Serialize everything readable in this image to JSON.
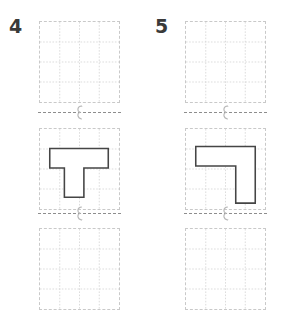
{
  "page": {
    "type": "geometry-worksheet",
    "background_color": "#ffffff",
    "grid_line_color": "#d2d2d2",
    "panel_border_color": "#c9c9c9",
    "shape_stroke_color": "#454545",
    "number_color": "#3a3a3a",
    "separator_color": "#8d8d8d"
  },
  "grid": {
    "columns": 4,
    "rows": 4,
    "cell_size_px": 20
  },
  "problems": [
    {
      "number": "4",
      "panels": [
        {
          "position": "top",
          "state": "empty",
          "shape": null
        },
        {
          "position": "middle",
          "state": "filled",
          "shape": {
            "name": "T-shape",
            "points": "10,20 70,20 70,40 45,40 45,70 25,70 25,40 10,40"
          }
        },
        {
          "position": "bottom",
          "state": "empty",
          "shape": null
        }
      ],
      "separators": [
        {
          "position": "upper",
          "glyph": "fold-arrow-icon"
        },
        {
          "position": "lower",
          "glyph": "fold-arrow-icon"
        }
      ]
    },
    {
      "number": "5",
      "panels": [
        {
          "position": "top",
          "state": "empty",
          "shape": null
        },
        {
          "position": "middle",
          "state": "filled",
          "shape": {
            "name": "L-shape",
            "points": "10,18 71,18 71,76 51,76 51,38 10,38"
          }
        },
        {
          "position": "bottom",
          "state": "empty",
          "shape": null
        }
      ],
      "separators": [
        {
          "position": "upper",
          "glyph": "fold-arrow-icon"
        },
        {
          "position": "lower",
          "glyph": "fold-arrow-icon"
        }
      ]
    }
  ]
}
